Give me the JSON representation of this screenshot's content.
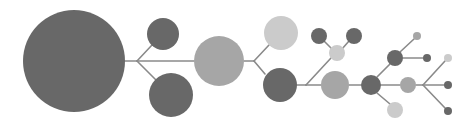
{
  "diagram": {
    "type": "branching-node-tree",
    "background": "#ffffff",
    "edge_color": "#8a8a8a",
    "edge_width": 1.6,
    "colors": {
      "dark": "#686868",
      "mid": "#a6a6a6",
      "light": "#cbcbcb"
    },
    "nodes": [
      {
        "id": "n1",
        "cx": 74,
        "cy": 61,
        "r": 51,
        "tone": "dark"
      },
      {
        "id": "n2",
        "cx": 163,
        "cy": 34,
        "r": 16,
        "tone": "dark"
      },
      {
        "id": "n3",
        "cx": 171,
        "cy": 95,
        "r": 22,
        "tone": "dark"
      },
      {
        "id": "n4",
        "cx": 219,
        "cy": 61,
        "r": 25,
        "tone": "mid"
      },
      {
        "id": "n5",
        "cx": 281,
        "cy": 33,
        "r": 17,
        "tone": "light"
      },
      {
        "id": "n6",
        "cx": 280,
        "cy": 85,
        "r": 17,
        "tone": "dark"
      },
      {
        "id": "n7",
        "cx": 337,
        "cy": 53,
        "r": 8,
        "tone": "light"
      },
      {
        "id": "n8",
        "cx": 319,
        "cy": 36,
        "r": 8,
        "tone": "dark"
      },
      {
        "id": "n9",
        "cx": 354,
        "cy": 36,
        "r": 8,
        "tone": "dark"
      },
      {
        "id": "n10",
        "cx": 335,
        "cy": 85,
        "r": 14,
        "tone": "mid"
      },
      {
        "id": "n11",
        "cx": 371,
        "cy": 85,
        "r": 10,
        "tone": "dark"
      },
      {
        "id": "n12",
        "cx": 395,
        "cy": 58,
        "r": 8,
        "tone": "dark"
      },
      {
        "id": "n13",
        "cx": 417,
        "cy": 36,
        "r": 4,
        "tone": "mid"
      },
      {
        "id": "n14",
        "cx": 427,
        "cy": 58,
        "r": 4,
        "tone": "dark"
      },
      {
        "id": "n15",
        "cx": 395,
        "cy": 110,
        "r": 8,
        "tone": "light"
      },
      {
        "id": "n16",
        "cx": 408,
        "cy": 85,
        "r": 8,
        "tone": "mid"
      },
      {
        "id": "n17",
        "cx": 448,
        "cy": 58,
        "r": 4,
        "tone": "light"
      },
      {
        "id": "n18",
        "cx": 448,
        "cy": 85,
        "r": 4,
        "tone": "dark"
      },
      {
        "id": "n19",
        "cx": 448,
        "cy": 111,
        "r": 4,
        "tone": "dark"
      }
    ],
    "edges": [
      [
        125,
        61,
        137,
        61
      ],
      [
        137,
        61,
        152,
        45
      ],
      [
        137,
        61,
        156,
        80
      ],
      [
        137,
        61,
        194,
        61
      ],
      [
        244,
        61,
        254,
        61
      ],
      [
        254,
        61,
        269,
        45
      ],
      [
        254,
        61,
        265,
        74
      ],
      [
        297,
        85,
        306,
        85
      ],
      [
        306,
        85,
        331,
        58
      ],
      [
        332,
        49,
        324,
        41
      ],
      [
        342,
        49,
        349,
        41
      ],
      [
        306,
        85,
        321,
        85
      ],
      [
        349,
        85,
        361,
        85
      ],
      [
        377,
        77,
        390,
        64
      ],
      [
        400,
        52,
        414,
        39
      ],
      [
        403,
        58,
        423,
        58
      ],
      [
        377,
        93,
        390,
        104
      ],
      [
        381,
        85,
        400,
        85
      ],
      [
        416,
        85,
        423,
        85
      ],
      [
        423,
        85,
        445,
        61
      ],
      [
        423,
        85,
        444,
        85
      ],
      [
        423,
        85,
        445,
        108
      ]
    ]
  }
}
